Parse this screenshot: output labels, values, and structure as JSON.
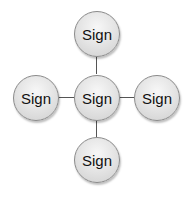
{
  "diagram": {
    "type": "hub-and-spoke",
    "center": {
      "label": "Sign"
    },
    "spokes": [
      {
        "position": "top",
        "label": "Sign"
      },
      {
        "position": "left",
        "label": "Sign"
      },
      {
        "position": "right",
        "label": "Sign"
      },
      {
        "position": "bottom",
        "label": "Sign"
      }
    ],
    "colors": {
      "node_fill": "#e6e6e6",
      "node_border": "#8a8a8a",
      "connector": "#555555",
      "text": "#111111"
    }
  }
}
